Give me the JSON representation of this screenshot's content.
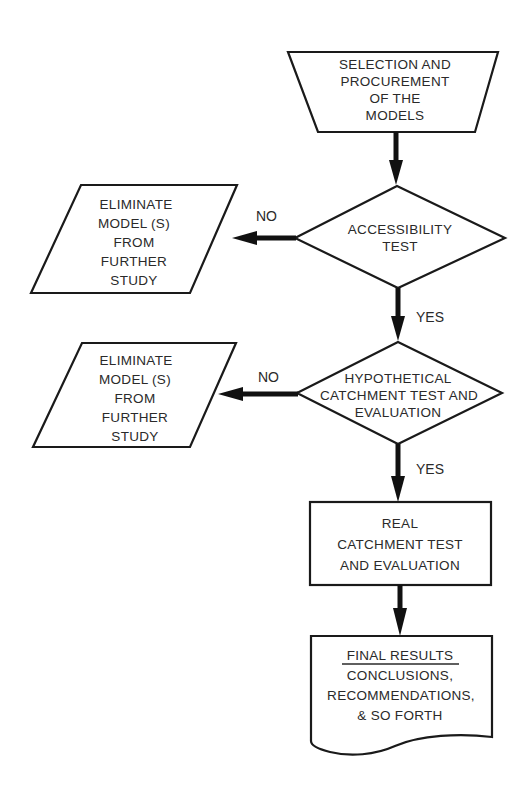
{
  "flowchart": {
    "start": {
      "shape": "manual-operation-trapezoid",
      "lines": [
        "SELECTION AND",
        "PROCUREMENT",
        "OF THE",
        "MODELS"
      ]
    },
    "decision_1": {
      "shape": "diamond",
      "lines": [
        "ACCESSIBILITY",
        "TEST"
      ]
    },
    "eliminate_1": {
      "shape": "parallelogram",
      "lines": [
        "ELIMINATE",
        "MODEL (S)",
        "FROM",
        "FURTHER",
        "STUDY"
      ]
    },
    "decision_2": {
      "shape": "diamond",
      "lines": [
        "HYPOTHETICAL",
        "CATCHMENT TEST AND",
        "EVALUATION"
      ]
    },
    "eliminate_2": {
      "shape": "parallelogram",
      "lines": [
        "ELIMINATE",
        "MODEL (S)",
        "FROM",
        "FURTHER",
        "STUDY"
      ]
    },
    "process": {
      "shape": "rectangle",
      "lines": [
        "REAL",
        "CATCHMENT TEST",
        "AND EVALUATION"
      ]
    },
    "result": {
      "shape": "document",
      "heading": "FINAL RESULTS",
      "lines": [
        "CONCLUSIONS,",
        "RECOMMENDATIONS,",
        "& SO FORTH"
      ]
    },
    "edges": {
      "d1_no": "NO",
      "d1_yes": "YES",
      "d2_no": "NO",
      "d2_yes": "YES"
    },
    "connections": [
      {
        "from": "start",
        "to": "decision_1",
        "label": ""
      },
      {
        "from": "decision_1",
        "to": "eliminate_1",
        "label": "NO"
      },
      {
        "from": "decision_1",
        "to": "decision_2",
        "label": "YES"
      },
      {
        "from": "decision_2",
        "to": "eliminate_2",
        "label": "NO"
      },
      {
        "from": "decision_2",
        "to": "process",
        "label": "YES"
      },
      {
        "from": "process",
        "to": "result",
        "label": ""
      }
    ]
  }
}
